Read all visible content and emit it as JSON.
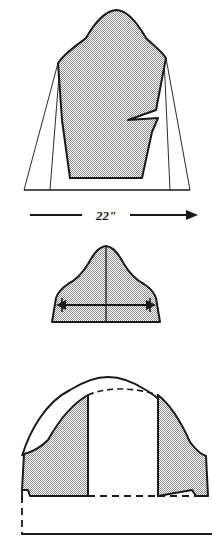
{
  "figure": {
    "background_color": "#ffffff",
    "ink_color": "#1a1a1a",
    "fill_color": "#b4b4b4",
    "panels": [
      {
        "id": "body-block",
        "name": "Kimono / dolman body block with underarm dart notch",
        "measurement_label": "22\"",
        "measurement_arrow": "right-arrow",
        "has_notch": true,
        "has_spread_lines": true
      },
      {
        "id": "sleeve-cap",
        "name": "Sleeve cap pattern with grainline and cap width arrow",
        "measurement_label": "",
        "measurement_arrow": "double-arrow",
        "has_centerline": true
      },
      {
        "id": "spread-cap",
        "name": "Sleeve cap spread open with dashed original cap line",
        "measurement_label": "",
        "has_dashed_original": true,
        "has_baseline": true
      }
    ]
  },
  "annotations": {
    "body_width": "22\"",
    "cap_width": "",
    "baseline": ""
  }
}
